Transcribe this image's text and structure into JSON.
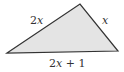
{
  "diagram": {
    "type": "triangle",
    "vertices": {
      "left": [
        7,
        53
      ],
      "top": [
        80,
        4
      ],
      "right": [
        118,
        51
      ]
    },
    "fill_color": "#e4e4e4",
    "stroke_color": "#333333",
    "sides": {
      "left_side": {
        "coef": "2",
        "var": "x",
        "rest": ""
      },
      "right_side": {
        "coef": "",
        "var": "x",
        "rest": ""
      },
      "base": {
        "coef": "2",
        "var": "x",
        "rest": " + 1"
      }
    }
  }
}
